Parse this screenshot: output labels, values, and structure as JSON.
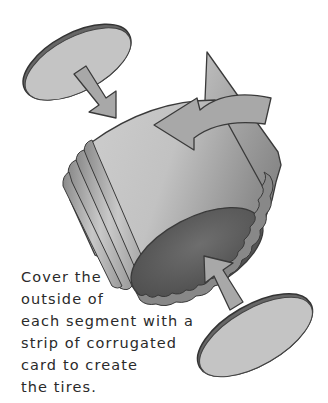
{
  "illustration": {
    "description": "Exploded view of a cardboard wheel segment: two grey disc wheels with arrows pointing toward a tilted cylinder wrapped with a corrugated card strip; a curved arrow shows the strip wrapping around.",
    "colors": {
      "disc_face": "#c4c4c4",
      "disc_rim": "#6a6a6a",
      "outline": "#3a3a3a",
      "arrow_fill": "#a8a8a8",
      "cylinder_light": "#d2d2d2",
      "cylinder_mid": "#b4b4b4",
      "cylinder_dark": "#7a7a7a",
      "inner_opening": "#5e5e5e",
      "background": "#ffffff"
    }
  },
  "caption": {
    "lines": [
      "Cover the",
      "outside of",
      "each segment with a",
      "strip of corrugated",
      "card to create",
      "the tires."
    ]
  }
}
